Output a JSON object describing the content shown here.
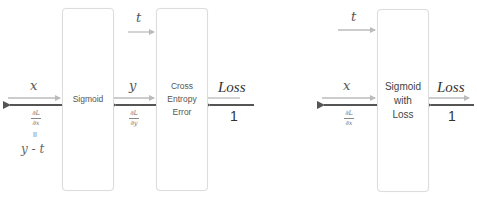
{
  "diagram": {
    "left": {
      "nodes": [
        {
          "id": "sigmoid",
          "label": "Sigmoid"
        },
        {
          "id": "cross_entropy",
          "label_lines": [
            "Cross",
            "Entropy",
            "Error"
          ]
        }
      ],
      "edges": {
        "input_x": {
          "forward_label": "x",
          "backward_num": "∂L",
          "backward_den": "∂x",
          "equals": "II",
          "equals_expr": "y - t"
        },
        "mid_y": {
          "forward_label": "y",
          "backward_num": "∂L",
          "backward_den": "∂y"
        },
        "target_t": {
          "forward_label": "t"
        },
        "output": {
          "forward_label": "Loss",
          "backward_label": "1"
        }
      }
    },
    "right": {
      "nodes": [
        {
          "id": "sigmoid_with_loss",
          "label_lines": [
            "Sigmoid",
            "with",
            "Loss"
          ]
        }
      ],
      "edges": {
        "input_x": {
          "forward_label": "x",
          "backward_num": "∂L",
          "backward_den": "∂x"
        },
        "target_t": {
          "forward_label": "t"
        },
        "output": {
          "forward_label": "Loss",
          "backward_label": "1"
        }
      }
    },
    "colors": {
      "forward_arrow": "#bbbbbb",
      "backward_arrow": "#555555",
      "box_border": "#dcdcdc"
    }
  }
}
